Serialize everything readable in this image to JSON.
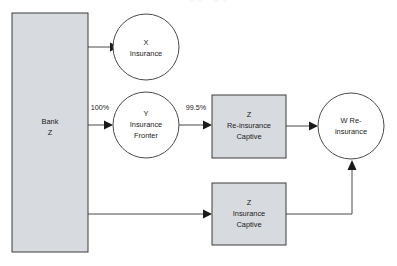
{
  "diagram": {
    "type": "flow-diagram",
    "title": "",
    "colors": {
      "box_fill": "#d7dbdf",
      "circle_fill": "#ffffff",
      "stroke": "#4a4a4a",
      "text": "#1a1a1a",
      "background": "#ffffff"
    },
    "nodes": [
      {
        "id": "bank-z",
        "shape": "rectangle",
        "fill": "#d7dbdf",
        "lines": [
          "Bank",
          "Z"
        ],
        "x": 12,
        "y": 13,
        "w": 76,
        "h": 239
      },
      {
        "id": "x-insurance",
        "shape": "circle",
        "fill": "#ffffff",
        "lines": [
          "X",
          "Insurance"
        ],
        "cx": 146,
        "cy": 47,
        "r": 33
      },
      {
        "id": "y-insurance-fronter",
        "shape": "circle",
        "fill": "#ffffff",
        "lines": [
          "Y",
          "Insurance",
          "Fronter"
        ],
        "cx": 146,
        "cy": 125,
        "r": 33
      },
      {
        "id": "z-reinsurance-captive",
        "shape": "rectangle",
        "fill": "#d7dbdf",
        "lines": [
          "Z",
          "Re-insurance",
          "Captive"
        ],
        "x": 212,
        "y": 95,
        "w": 74,
        "h": 63
      },
      {
        "id": "w-reinsurance",
        "shape": "circle",
        "fill": "#ffffff",
        "lines": [
          "W Re-",
          "insurance"
        ],
        "cx": 351,
        "cy": 126,
        "r": 33
      },
      {
        "id": "z-insurance-captive",
        "shape": "rectangle",
        "fill": "#d7dbdf",
        "lines": [
          "Z",
          "Insurance",
          "Captive"
        ],
        "x": 212,
        "y": 183,
        "w": 74,
        "h": 62
      }
    ],
    "edges": [
      {
        "id": "bank-to-x",
        "from": "bank-z",
        "to": "x-insurance",
        "label": ""
      },
      {
        "id": "bank-to-y",
        "from": "bank-z",
        "to": "y-insurance-fronter",
        "label": "100%"
      },
      {
        "id": "y-to-zre",
        "from": "y-insurance-fronter",
        "to": "z-reinsurance-captive",
        "label": "99.5%"
      },
      {
        "id": "zre-to-w",
        "from": "z-reinsurance-captive",
        "to": "w-reinsurance",
        "label": ""
      },
      {
        "id": "bank-to-zins",
        "from": "bank-z",
        "to": "z-insurance-captive",
        "label": ""
      },
      {
        "id": "zins-to-w",
        "from": "z-insurance-captive",
        "to": "w-reinsurance",
        "label": ""
      }
    ],
    "labels": {
      "bank_line1": "Bank",
      "bank_line2": "Z",
      "x_line1": "X",
      "x_line2": "Insurance",
      "y_line1": "Y",
      "y_line2": "Insurance",
      "y_line3": "Fronter",
      "zre_line1": "Z",
      "zre_line2": "Re-insurance",
      "zre_line3": "Captive",
      "w_line1": "W Re-",
      "w_line2": "insurance",
      "zins_line1": "Z",
      "zins_line2": "Insurance",
      "zins_line3": "Captive",
      "pct_100": "100%",
      "pct_995": "99.5%"
    }
  }
}
